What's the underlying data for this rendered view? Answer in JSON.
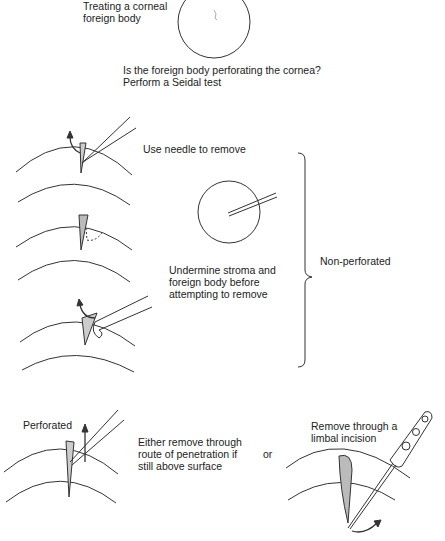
{
  "title": "Treating a corneal\nforeign body",
  "question": "Is the foreign body perforating the cornea?\nPerform a Seidal test",
  "steps": {
    "needle": "Use needle to remove",
    "undermine": "Undermine stroma and\nforeign body before\nattempting to remove",
    "non_perforated": "Non-perforated",
    "perforated": "Perforated",
    "route": "Either remove through\nroute of penetration if\nstill above surface",
    "or": "or",
    "limbal": "Remove through a\nlimbal incision"
  },
  "colors": {
    "line": "#333333",
    "fill_fb": "#bbbbbb",
    "text": "#222222"
  }
}
